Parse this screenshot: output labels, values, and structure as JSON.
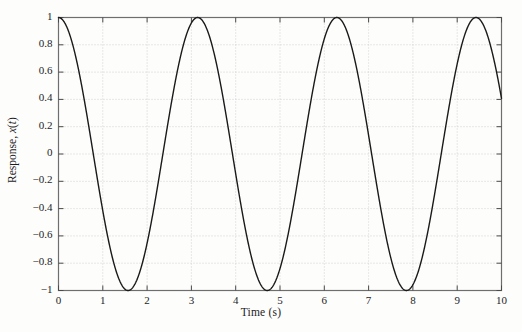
{
  "figure": {
    "background_color": "#fdfdfc",
    "frame_color": "#6e6e6e",
    "grid_color": "#c8c8c8",
    "curve_color": "#1a1a1a"
  },
  "axes": {
    "xlabel": "Time (s)",
    "ylabel_prefix": "Response, ",
    "ylabel_var": "x",
    "ylabel_open": "(",
    "ylabel_t": "t",
    "ylabel_close": ")",
    "ylabel_full": "Response, x(t)",
    "xticks": [
      "0",
      "1",
      "2",
      "3",
      "4",
      "5",
      "6",
      "7",
      "8",
      "9",
      "10"
    ],
    "yticks": [
      "1",
      "0.8",
      "0.6",
      "0.4",
      "0.2",
      "0",
      "−0.2",
      "−0.4",
      "−0.6",
      "−0.8",
      "−1"
    ]
  },
  "chart_data": {
    "type": "line",
    "title": "",
    "subtitle": "",
    "xlabel": "Time (s)",
    "ylabel": "Response, x(t)",
    "xlim": [
      0,
      10
    ],
    "ylim": [
      -1,
      1
    ],
    "xticks": [
      0,
      1,
      2,
      3,
      4,
      5,
      6,
      7,
      8,
      9,
      10
    ],
    "yticks": [
      -1,
      -0.8,
      -0.6,
      -0.4,
      -0.2,
      0,
      0.2,
      0.4,
      0.6,
      0.8,
      1
    ],
    "grid": true,
    "grid_style": "dotted",
    "legend": null,
    "legend_position": "none",
    "series": [
      {
        "name": "x(t)",
        "expression": "cos(2t)",
        "amplitude": 1,
        "angular_frequency": 2,
        "phase": 0,
        "period": 3.1416,
        "color": "#1a1a1a",
        "linewidth": 1.4,
        "x": [
          0.0,
          0.1,
          0.2,
          0.3,
          0.4,
          0.5,
          0.6,
          0.7,
          0.8,
          0.9,
          1.0,
          1.1,
          1.2,
          1.3,
          1.4,
          1.5,
          1.6,
          1.7,
          1.8,
          1.9,
          2.0,
          2.1,
          2.2,
          2.3,
          2.4,
          2.5,
          2.6,
          2.7,
          2.8,
          2.9,
          3.0,
          3.1,
          3.2,
          3.3,
          3.4,
          3.5,
          3.6,
          3.7,
          3.8,
          3.9,
          4.0,
          4.1,
          4.2,
          4.3,
          4.4,
          4.5,
          4.6,
          4.7,
          4.8,
          4.9,
          5.0,
          5.1,
          5.2,
          5.3,
          5.4,
          5.5,
          5.6,
          5.7,
          5.8,
          5.9,
          6.0,
          6.1,
          6.2,
          6.3,
          6.4,
          6.5,
          6.6,
          6.7,
          6.8,
          6.9,
          7.0,
          7.1,
          7.2,
          7.3,
          7.4,
          7.5,
          7.6,
          7.7,
          7.8,
          7.9,
          8.0,
          8.1,
          8.2,
          8.3,
          8.4,
          8.5,
          8.6,
          8.7,
          8.8,
          8.9,
          9.0,
          9.1,
          9.2,
          9.3,
          9.4,
          9.5,
          9.6,
          9.7,
          9.8,
          9.9,
          10.0
        ],
        "y": [
          1.0,
          0.98,
          0.921,
          0.825,
          0.697,
          0.54,
          0.362,
          0.17,
          -0.029,
          -0.227,
          -0.416,
          -0.588,
          -0.737,
          -0.857,
          -0.942,
          -0.99,
          -0.998,
          -0.967,
          -0.896,
          -0.79,
          -0.654,
          -0.492,
          -0.312,
          -0.12,
          0.08,
          0.284,
          0.469,
          0.634,
          0.776,
          0.885,
          0.96,
          0.998,
          0.996,
          0.955,
          0.876,
          0.762,
          0.618,
          0.45,
          0.266,
          0.071,
          -0.146,
          -0.337,
          -0.519,
          -0.679,
          -0.811,
          -0.911,
          -0.976,
          -1.0,
          -0.988,
          -0.937,
          -0.839,
          -0.719,
          -0.571,
          -0.404,
          -0.225,
          -0.04,
          0.155,
          0.361,
          0.548,
          0.705,
          0.843,
          0.932,
          0.985,
          0.999,
          0.973,
          0.908,
          0.807,
          0.673,
          0.513,
          0.334,
          0.144,
          -0.056,
          -0.253,
          -0.44,
          -0.61,
          -0.755,
          -0.869,
          -0.947,
          -0.987,
          -0.987,
          -0.958,
          -0.89,
          -0.785,
          -0.647,
          -0.485,
          -0.306,
          -0.117,
          0.083,
          0.281,
          0.465,
          0.631,
          0.775,
          0.884,
          0.959,
          0.997,
          0.997,
          0.958,
          0.882,
          0.771,
          0.629,
          0.462
        ]
      }
    ],
    "annotations": [],
    "peaks_t": [
      0,
      3.1416,
      6.2832,
      9.4248
    ],
    "troughs_t": [
      1.5708,
      4.7124,
      7.854
    ]
  }
}
